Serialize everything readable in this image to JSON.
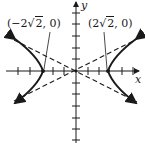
{
  "diagram": {
    "type": "hyperbola",
    "axes": {
      "x_label": "x",
      "y_label": "y"
    },
    "vertices": [
      {
        "label_open": "(",
        "label_coef": "−2",
        "label_rad": "2",
        "label_close": ", 0)",
        "x": -2.828,
        "y": 0
      },
      {
        "label_open": "(",
        "label_coef": "2",
        "label_rad": "2",
        "label_close": ", 0)",
        "x": 2.828,
        "y": 0
      }
    ],
    "asymptotes": "dashed lines through origin",
    "colors": {
      "ink": "#1a1a1a",
      "background": "#ffffff"
    },
    "x_ticks": [
      -6,
      -5,
      -4,
      -3,
      -2,
      -1,
      1,
      2,
      3,
      4,
      5,
      6
    ],
    "y_ticks": [
      -6,
      -5,
      -4,
      -3,
      -2,
      -1,
      1,
      2,
      3,
      4,
      5,
      6
    ]
  }
}
